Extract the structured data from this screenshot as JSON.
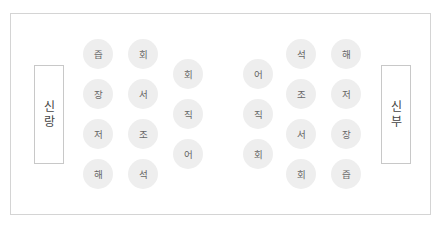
{
  "groom": {
    "label_chars": [
      "신",
      "랑"
    ],
    "label": "신랑"
  },
  "bride": {
    "label_chars": [
      "신",
      "부"
    ],
    "label": "신부"
  },
  "seats": [
    {
      "id": "L1-1",
      "label": "즙",
      "x": 98,
      "y": 54
    },
    {
      "id": "L1-2",
      "label": "장",
      "x": 98,
      "y": 94
    },
    {
      "id": "L1-3",
      "label": "저",
      "x": 98,
      "y": 134
    },
    {
      "id": "L1-4",
      "label": "해",
      "x": 98,
      "y": 174
    },
    {
      "id": "L2-1",
      "label": "회",
      "x": 143,
      "y": 54
    },
    {
      "id": "L2-2",
      "label": "서",
      "x": 143,
      "y": 94
    },
    {
      "id": "L2-3",
      "label": "조",
      "x": 143,
      "y": 134
    },
    {
      "id": "L2-4",
      "label": "석",
      "x": 143,
      "y": 174
    },
    {
      "id": "L3-1",
      "label": "회",
      "x": 188,
      "y": 74
    },
    {
      "id": "L3-2",
      "label": "직",
      "x": 188,
      "y": 114
    },
    {
      "id": "L3-3",
      "label": "어",
      "x": 188,
      "y": 154
    },
    {
      "id": "R3-1",
      "label": "어",
      "x": 258,
      "y": 74
    },
    {
      "id": "R3-2",
      "label": "직",
      "x": 258,
      "y": 114
    },
    {
      "id": "R3-3",
      "label": "회",
      "x": 258,
      "y": 154
    },
    {
      "id": "R2-1",
      "label": "석",
      "x": 301,
      "y": 54
    },
    {
      "id": "R2-2",
      "label": "조",
      "x": 301,
      "y": 94
    },
    {
      "id": "R2-3",
      "label": "서",
      "x": 301,
      "y": 134
    },
    {
      "id": "R2-4",
      "label": "회",
      "x": 301,
      "y": 174
    },
    {
      "id": "R1-1",
      "label": "해",
      "x": 346,
      "y": 54
    },
    {
      "id": "R1-2",
      "label": "저",
      "x": 346,
      "y": 94
    },
    {
      "id": "R1-3",
      "label": "장",
      "x": 346,
      "y": 134
    },
    {
      "id": "R1-4",
      "label": "즙",
      "x": 346,
      "y": 174
    }
  ],
  "colors": {
    "seat_fill": "#eeeeee",
    "seat_text": "#666666",
    "box_border": "#c8c8c8",
    "box_text": "#444444",
    "frame_border": "#d4d4d4"
  }
}
